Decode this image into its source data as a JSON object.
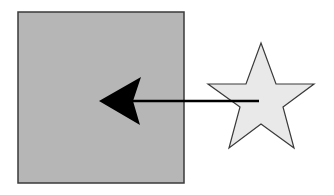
{
  "diagram": {
    "square": {
      "shape": "square",
      "x": 18,
      "y": 12,
      "width": 166,
      "height": 171,
      "fill": "#b6b6b6",
      "stroke": "#3a3a3a"
    },
    "star": {
      "shape": "five-point-star",
      "points": "261,43 276,84 314,84 283,107 294,148 261,124 229,148 240,107 208,84 246,84",
      "fill": "#e9e9e9",
      "stroke": "#3a3a3a"
    },
    "arrow": {
      "direction": "left",
      "from": "star-center",
      "to": "square-center",
      "line": {
        "x1": 259,
        "y1": 101,
        "x2": 130,
        "y2": 101
      },
      "head": "99,101 141,77 133,101 140,125",
      "color": "#000000"
    }
  }
}
